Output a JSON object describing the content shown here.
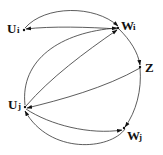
{
  "diagram": {
    "nodes": [
      {
        "id": "Ui",
        "main": "U",
        "sub": "i"
      },
      {
        "id": "Wi",
        "main": "W",
        "sub": "i"
      },
      {
        "id": "Z",
        "main": "Z",
        "sub": ""
      },
      {
        "id": "Uj",
        "main": "U",
        "sub": "j"
      },
      {
        "id": "Wj",
        "main": "W",
        "sub": "j"
      }
    ],
    "edges": [
      {
        "from": "Ui",
        "to": "Wi",
        "style": "arc-top"
      },
      {
        "from": "Wi",
        "to": "Ui",
        "style": "straight"
      },
      {
        "from": "Wi",
        "to": "Z",
        "style": "arc-right"
      },
      {
        "from": "Z",
        "to": "Wj",
        "style": "arc-right"
      },
      {
        "from": "Uj",
        "to": "Wi",
        "style": "straight"
      },
      {
        "from": "Uj",
        "to": "Wi",
        "style": "arc-left"
      },
      {
        "from": "Z",
        "to": "Uj",
        "style": "straight"
      },
      {
        "from": "Uj",
        "to": "Wj",
        "style": "arc"
      },
      {
        "from": "Wj",
        "to": "Uj",
        "style": "arc-bottom"
      }
    ],
    "stroke_color": "#333333"
  }
}
